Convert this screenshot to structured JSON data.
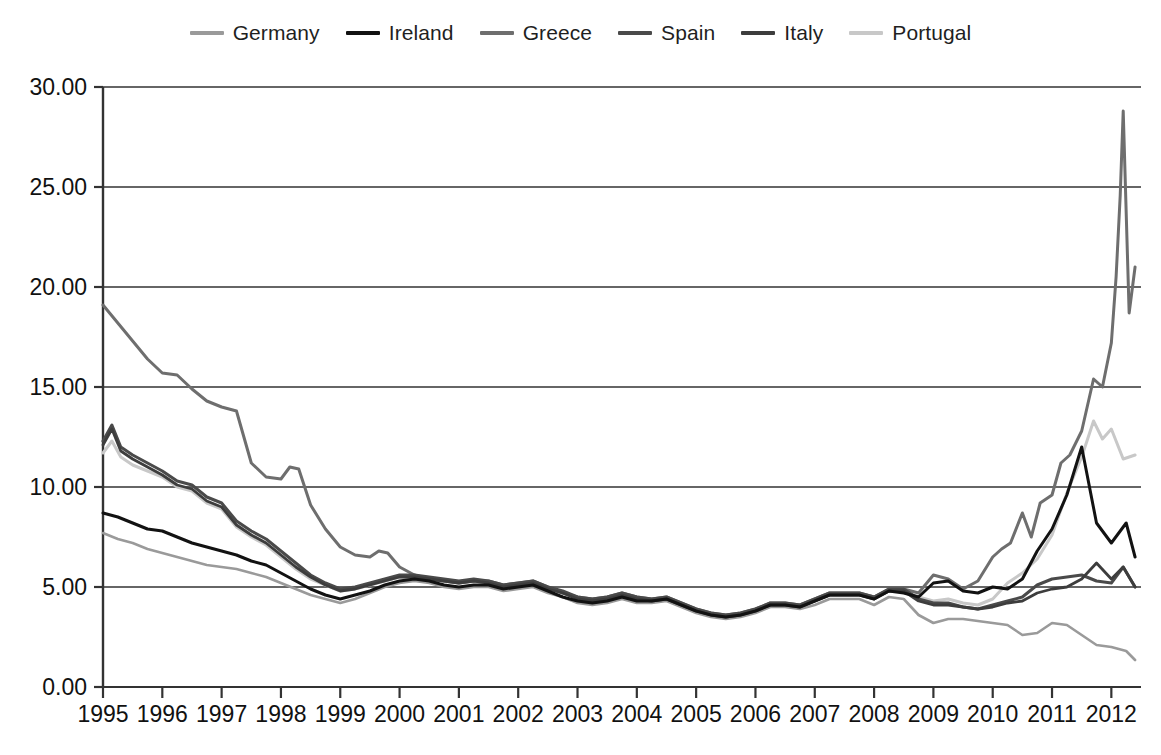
{
  "chart_data": {
    "type": "line",
    "title": "",
    "subtitle": "",
    "xlabel": "",
    "ylabel": "",
    "xlim": [
      1995.0,
      2012.5
    ],
    "ylim": [
      0.0,
      30.0
    ],
    "grid": "horizontal",
    "legend_position": "top-center",
    "y_ticks": [
      "0.00",
      "5.00",
      "10.00",
      "15.00",
      "20.00",
      "25.00",
      "30.00"
    ],
    "y_tick_values": [
      0,
      5,
      10,
      15,
      20,
      25,
      30
    ],
    "x_ticks": [
      "1995",
      "1996",
      "1997",
      "1998",
      "1999",
      "2000",
      "2001",
      "2002",
      "2003",
      "2004",
      "2005",
      "2006",
      "2007",
      "2008",
      "2009",
      "2010",
      "2011",
      "2012"
    ],
    "x_tick_values": [
      1995,
      1996,
      1997,
      1998,
      1999,
      2000,
      2001,
      2002,
      2003,
      2004,
      2005,
      2006,
      2007,
      2008,
      2009,
      2010,
      2011,
      2012
    ],
    "series": [
      {
        "name": "Germany",
        "color": "#9a9a9a",
        "width": 2.6,
        "x": [
          1995.0,
          1995.25,
          1995.5,
          1995.75,
          1996.0,
          1996.25,
          1996.5,
          1996.75,
          1997.0,
          1997.25,
          1997.5,
          1997.75,
          1998.0,
          1998.25,
          1998.5,
          1998.75,
          1999.0,
          1999.25,
          1999.5,
          1999.75,
          2000.0,
          2000.25,
          2000.5,
          2000.75,
          2001.0,
          2001.25,
          2001.5,
          2001.75,
          2002.0,
          2002.25,
          2002.5,
          2002.75,
          2003.0,
          2003.25,
          2003.5,
          2003.75,
          2004.0,
          2004.25,
          2004.5,
          2004.75,
          2005.0,
          2005.25,
          2005.5,
          2005.75,
          2006.0,
          2006.25,
          2006.5,
          2006.75,
          2007.0,
          2007.25,
          2007.5,
          2007.75,
          2008.0,
          2008.25,
          2008.5,
          2008.75,
          2009.0,
          2009.25,
          2009.5,
          2009.75,
          2010.0,
          2010.25,
          2010.5,
          2010.75,
          2011.0,
          2011.25,
          2011.5,
          2011.75,
          2012.0,
          2012.25,
          2012.4
        ],
        "y": [
          7.7,
          7.4,
          7.2,
          6.9,
          6.7,
          6.5,
          6.3,
          6.1,
          6.0,
          5.9,
          5.7,
          5.5,
          5.2,
          4.9,
          4.6,
          4.4,
          4.2,
          4.4,
          4.7,
          5.0,
          5.2,
          5.3,
          5.2,
          5.0,
          4.9,
          5.0,
          5.0,
          4.8,
          4.9,
          5.0,
          4.7,
          4.5,
          4.2,
          4.1,
          4.2,
          4.4,
          4.2,
          4.2,
          4.3,
          4.0,
          3.7,
          3.5,
          3.4,
          3.5,
          3.7,
          4.0,
          4.0,
          3.9,
          4.1,
          4.4,
          4.4,
          4.4,
          4.1,
          4.5,
          4.4,
          3.6,
          3.2,
          3.4,
          3.4,
          3.3,
          3.2,
          3.1,
          2.6,
          2.7,
          3.2,
          3.1,
          2.6,
          2.1,
          2.0,
          1.8,
          1.35
        ]
      },
      {
        "name": "Ireland",
        "color": "#121212",
        "width": 3.0,
        "x": [
          1995.0,
          1995.25,
          1995.5,
          1995.75,
          1996.0,
          1996.25,
          1996.5,
          1996.75,
          1997.0,
          1997.25,
          1997.5,
          1997.75,
          1998.0,
          1998.25,
          1998.5,
          1998.75,
          1999.0,
          1999.25,
          1999.5,
          1999.75,
          2000.0,
          2000.25,
          2000.5,
          2000.75,
          2001.0,
          2001.25,
          2001.5,
          2001.75,
          2002.0,
          2002.25,
          2002.5,
          2002.75,
          2003.0,
          2003.25,
          2003.5,
          2003.75,
          2004.0,
          2004.25,
          2004.5,
          2004.75,
          2005.0,
          2005.25,
          2005.5,
          2005.75,
          2006.0,
          2006.25,
          2006.5,
          2006.75,
          2007.0,
          2007.25,
          2007.5,
          2007.75,
          2008.0,
          2008.25,
          2008.5,
          2008.75,
          2009.0,
          2009.25,
          2009.5,
          2009.75,
          2010.0,
          2010.25,
          2010.5,
          2010.75,
          2011.0,
          2011.25,
          2011.5,
          2011.75,
          2012.0,
          2012.25,
          2012.4
        ],
        "y": [
          8.7,
          8.5,
          8.2,
          7.9,
          7.8,
          7.5,
          7.2,
          7.0,
          6.8,
          6.6,
          6.3,
          6.1,
          5.7,
          5.3,
          4.9,
          4.6,
          4.4,
          4.6,
          4.8,
          5.1,
          5.3,
          5.4,
          5.3,
          5.1,
          5.0,
          5.1,
          5.1,
          4.9,
          5.0,
          5.1,
          4.8,
          4.5,
          4.3,
          4.2,
          4.3,
          4.5,
          4.3,
          4.3,
          4.4,
          4.1,
          3.8,
          3.6,
          3.5,
          3.6,
          3.8,
          4.1,
          4.1,
          4.0,
          4.3,
          4.6,
          4.6,
          4.6,
          4.4,
          4.8,
          4.7,
          4.5,
          5.2,
          5.3,
          4.8,
          4.7,
          5.0,
          4.9,
          5.4,
          6.8,
          7.9,
          9.6,
          12.0,
          8.2,
          7.2,
          8.2,
          6.5
        ]
      },
      {
        "name": "Greece",
        "color": "#6e6e6e",
        "width": 3.0,
        "x": [
          1995.0,
          1995.25,
          1995.5,
          1995.75,
          1996.0,
          1996.25,
          1996.5,
          1996.75,
          1997.0,
          1997.25,
          1997.5,
          1997.75,
          1998.0,
          1998.15,
          1998.3,
          1998.5,
          1998.75,
          1999.0,
          1999.25,
          1999.5,
          1999.65,
          1999.8,
          2000.0,
          2000.25,
          2000.5,
          2000.75,
          2001.0,
          2001.25,
          2001.5,
          2001.75,
          2002.0,
          2002.25,
          2002.5,
          2002.75,
          2003.0,
          2003.25,
          2003.5,
          2003.75,
          2004.0,
          2004.25,
          2004.5,
          2004.75,
          2005.0,
          2005.25,
          2005.5,
          2005.75,
          2006.0,
          2006.25,
          2006.5,
          2006.75,
          2007.0,
          2007.25,
          2007.5,
          2007.75,
          2008.0,
          2008.25,
          2008.5,
          2008.75,
          2009.0,
          2009.25,
          2009.5,
          2009.75,
          2010.0,
          2010.15,
          2010.3,
          2010.5,
          2010.65,
          2010.8,
          2011.0,
          2011.15,
          2011.3,
          2011.5,
          2011.7,
          2011.85,
          2012.0,
          2012.08,
          2012.15,
          2012.2,
          2012.3,
          2012.4
        ],
        "y": [
          19.1,
          18.2,
          17.3,
          16.4,
          15.7,
          15.6,
          14.9,
          14.3,
          14.0,
          13.8,
          11.2,
          10.5,
          10.4,
          11.0,
          10.9,
          9.1,
          7.9,
          7.0,
          6.6,
          6.5,
          6.8,
          6.7,
          6.0,
          5.6,
          5.4,
          5.3,
          5.2,
          5.3,
          5.3,
          5.1,
          5.2,
          5.3,
          5.0,
          4.7,
          4.5,
          4.4,
          4.5,
          4.7,
          4.5,
          4.4,
          4.5,
          4.2,
          3.9,
          3.7,
          3.6,
          3.7,
          3.9,
          4.2,
          4.2,
          4.1,
          4.4,
          4.7,
          4.7,
          4.7,
          4.5,
          4.9,
          4.9,
          4.7,
          5.6,
          5.4,
          4.9,
          5.3,
          6.5,
          6.9,
          7.2,
          8.7,
          7.5,
          9.2,
          9.6,
          11.2,
          11.6,
          12.8,
          15.4,
          15.0,
          17.2,
          20.5,
          24.6,
          28.8,
          18.7,
          21.0
        ]
      },
      {
        "name": "Spain",
        "color": "#4a4a4a",
        "width": 3.0,
        "x": [
          1995.0,
          1995.15,
          1995.3,
          1995.5,
          1995.75,
          1996.0,
          1996.25,
          1996.5,
          1996.75,
          1997.0,
          1997.25,
          1997.5,
          1997.75,
          1998.0,
          1998.25,
          1998.5,
          1998.75,
          1999.0,
          1999.25,
          1999.5,
          1999.75,
          2000.0,
          2000.25,
          2000.5,
          2000.75,
          2001.0,
          2001.25,
          2001.5,
          2001.75,
          2002.0,
          2002.25,
          2002.5,
          2002.75,
          2003.0,
          2003.25,
          2003.5,
          2003.75,
          2004.0,
          2004.25,
          2004.5,
          2004.75,
          2005.0,
          2005.25,
          2005.5,
          2005.75,
          2006.0,
          2006.25,
          2006.5,
          2006.75,
          2007.0,
          2007.25,
          2007.5,
          2007.75,
          2008.0,
          2008.25,
          2008.5,
          2008.75,
          2009.0,
          2009.25,
          2009.5,
          2009.75,
          2010.0,
          2010.25,
          2010.5,
          2010.75,
          2011.0,
          2011.25,
          2011.5,
          2011.75,
          2012.0,
          2012.2,
          2012.4
        ],
        "y": [
          12.3,
          13.1,
          12.0,
          11.6,
          11.2,
          10.8,
          10.3,
          10.1,
          9.5,
          9.2,
          8.3,
          7.8,
          7.4,
          6.8,
          6.2,
          5.6,
          5.2,
          4.9,
          5.0,
          5.2,
          5.4,
          5.6,
          5.6,
          5.5,
          5.4,
          5.3,
          5.4,
          5.3,
          5.1,
          5.2,
          5.3,
          5.0,
          4.8,
          4.5,
          4.4,
          4.5,
          4.7,
          4.5,
          4.4,
          4.5,
          4.2,
          3.9,
          3.7,
          3.6,
          3.7,
          3.9,
          4.2,
          4.2,
          4.1,
          4.4,
          4.7,
          4.7,
          4.7,
          4.5,
          4.9,
          4.9,
          4.4,
          4.2,
          4.2,
          4.0,
          3.9,
          4.1,
          4.3,
          4.5,
          5.1,
          5.4,
          5.5,
          5.6,
          5.3,
          5.2,
          6.0,
          5.0
        ]
      },
      {
        "name": "Italy",
        "color": "#3d3d3d",
        "width": 2.8,
        "x": [
          1995.0,
          1995.15,
          1995.3,
          1995.5,
          1995.75,
          1996.0,
          1996.25,
          1996.5,
          1996.75,
          1997.0,
          1997.25,
          1997.5,
          1997.75,
          1998.0,
          1998.25,
          1998.5,
          1998.75,
          1999.0,
          1999.25,
          1999.5,
          1999.75,
          2000.0,
          2000.25,
          2000.5,
          2000.75,
          2001.0,
          2001.25,
          2001.5,
          2001.75,
          2002.0,
          2002.25,
          2002.5,
          2002.75,
          2003.0,
          2003.25,
          2003.5,
          2003.75,
          2004.0,
          2004.25,
          2004.5,
          2004.75,
          2005.0,
          2005.25,
          2005.5,
          2005.75,
          2006.0,
          2006.25,
          2006.5,
          2006.75,
          2007.0,
          2007.25,
          2007.5,
          2007.75,
          2008.0,
          2008.25,
          2008.5,
          2008.75,
          2009.0,
          2009.25,
          2009.5,
          2009.75,
          2010.0,
          2010.25,
          2010.5,
          2010.75,
          2011.0,
          2011.25,
          2011.5,
          2011.75,
          2012.0,
          2012.2,
          2012.4
        ],
        "y": [
          12.1,
          12.9,
          11.8,
          11.4,
          11.0,
          10.6,
          10.1,
          9.9,
          9.3,
          9.0,
          8.1,
          7.6,
          7.2,
          6.6,
          6.0,
          5.5,
          5.1,
          4.8,
          4.9,
          5.1,
          5.3,
          5.5,
          5.5,
          5.4,
          5.3,
          5.2,
          5.3,
          5.2,
          5.0,
          5.1,
          5.2,
          4.9,
          4.7,
          4.4,
          4.3,
          4.4,
          4.6,
          4.4,
          4.3,
          4.4,
          4.1,
          3.8,
          3.6,
          3.5,
          3.6,
          3.8,
          4.1,
          4.1,
          4.0,
          4.3,
          4.6,
          4.6,
          4.6,
          4.4,
          4.8,
          4.8,
          4.3,
          4.1,
          4.1,
          4.0,
          3.9,
          4.0,
          4.2,
          4.3,
          4.7,
          4.9,
          5.0,
          5.4,
          6.2,
          5.4,
          6.0,
          5.0
        ]
      },
      {
        "name": "Portugal",
        "color": "#c8c8c8",
        "width": 3.0,
        "x": [
          1995.0,
          1995.15,
          1995.3,
          1995.5,
          1995.75,
          1996.0,
          1996.25,
          1996.5,
          1996.75,
          1997.0,
          1997.25,
          1997.5,
          1997.75,
          1998.0,
          1998.25,
          1998.5,
          1998.75,
          1999.0,
          1999.25,
          1999.5,
          1999.75,
          2000.0,
          2000.25,
          2000.5,
          2000.75,
          2001.0,
          2001.25,
          2001.5,
          2001.75,
          2002.0,
          2002.25,
          2002.5,
          2002.75,
          2003.0,
          2003.25,
          2003.5,
          2003.75,
          2004.0,
          2004.25,
          2004.5,
          2004.75,
          2005.0,
          2005.25,
          2005.5,
          2005.75,
          2006.0,
          2006.25,
          2006.5,
          2006.75,
          2007.0,
          2007.25,
          2007.5,
          2007.75,
          2008.0,
          2008.25,
          2008.5,
          2008.75,
          2009.0,
          2009.25,
          2009.5,
          2009.75,
          2010.0,
          2010.25,
          2010.5,
          2010.75,
          2011.0,
          2011.25,
          2011.5,
          2011.7,
          2011.85,
          2012.0,
          2012.2,
          2012.4
        ],
        "y": [
          11.7,
          12.3,
          11.5,
          11.1,
          10.8,
          10.5,
          10.0,
          9.8,
          9.2,
          8.9,
          8.0,
          7.5,
          7.1,
          6.5,
          5.9,
          5.4,
          5.1,
          4.8,
          4.9,
          5.1,
          5.3,
          5.5,
          5.5,
          5.4,
          5.3,
          5.2,
          5.3,
          5.2,
          5.0,
          5.1,
          5.2,
          4.9,
          4.7,
          4.4,
          4.3,
          4.4,
          4.6,
          4.4,
          4.3,
          4.4,
          4.1,
          3.8,
          3.6,
          3.5,
          3.6,
          3.8,
          4.1,
          4.1,
          4.0,
          4.3,
          4.6,
          4.6,
          4.6,
          4.4,
          4.8,
          4.8,
          4.5,
          4.3,
          4.4,
          4.2,
          4.1,
          4.4,
          5.2,
          5.7,
          6.4,
          7.6,
          9.7,
          11.5,
          13.3,
          12.4,
          12.9,
          11.4,
          11.6
        ]
      }
    ]
  },
  "legend": {
    "items": [
      {
        "label": "Germany",
        "color": "#9a9a9a"
      },
      {
        "label": "Ireland",
        "color": "#121212"
      },
      {
        "label": "Greece",
        "color": "#6e6e6e"
      },
      {
        "label": "Spain",
        "color": "#4a4a4a"
      },
      {
        "label": "Italy",
        "color": "#3d3d3d"
      },
      {
        "label": "Portugal",
        "color": "#c8c8c8"
      }
    ]
  },
  "axes": {
    "plot_left": 103,
    "plot_right": 1141,
    "plot_top": 87,
    "plot_bottom": 687,
    "gridline_color": "#333333",
    "axis_color": "#333333"
  }
}
